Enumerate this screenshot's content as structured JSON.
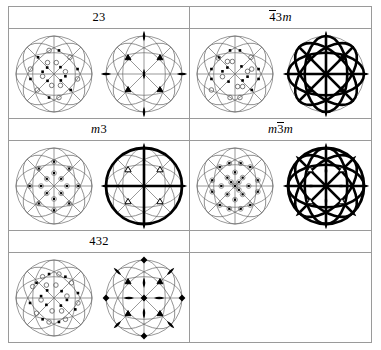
{
  "table": {
    "rows": [
      {
        "headers": [
          {
            "name": "point-group-23",
            "parts": [
              {
                "t": "23",
                "style": "plain"
              }
            ]
          },
          {
            "name": "point-group-4bar3m",
            "parts": [
              {
                "t": "4",
                "style": "overbar"
              },
              {
                "t": "3",
                "style": "plain"
              },
              {
                "t": "m",
                "style": "italic"
              }
            ]
          }
        ],
        "cells": [
          {
            "name": "stereogram-23",
            "kind": "projection",
            "group": "23"
          },
          {
            "name": "symmetry-diagram-23",
            "kind": "symmetry",
            "group": "23"
          },
          {
            "name": "stereogram-4bar3m",
            "kind": "projection",
            "group": "-43m"
          },
          {
            "name": "symmetry-diagram-4bar3m",
            "kind": "symmetry",
            "group": "-43m"
          }
        ]
      },
      {
        "headers": [
          {
            "name": "point-group-m3",
            "parts": [
              {
                "t": "m",
                "style": "italic"
              },
              {
                "t": "3",
                "style": "plain"
              }
            ]
          },
          {
            "name": "point-group-m3barm",
            "parts": [
              {
                "t": "m",
                "style": "italic"
              },
              {
                "t": "3",
                "style": "overbar"
              },
              {
                "t": "m",
                "style": "italic"
              }
            ]
          }
        ],
        "cells": [
          {
            "name": "stereogram-m3",
            "kind": "projection",
            "group": "m3"
          },
          {
            "name": "symmetry-diagram-m3",
            "kind": "symmetry",
            "group": "m3"
          },
          {
            "name": "stereogram-m3barm",
            "kind": "projection",
            "group": "m-3m"
          },
          {
            "name": "symmetry-diagram-m3barm",
            "kind": "symmetry",
            "group": "m-3m"
          }
        ]
      },
      {
        "headers": [
          {
            "name": "point-group-432",
            "parts": [
              {
                "t": "432",
                "style": "plain"
              }
            ]
          },
          {
            "name": "point-group-empty",
            "parts": []
          }
        ],
        "cells": [
          {
            "name": "stereogram-432",
            "kind": "projection",
            "group": "432"
          },
          {
            "name": "symmetry-diagram-432",
            "kind": "symmetry",
            "group": "432"
          },
          {
            "name": "empty-cell-1",
            "kind": "empty",
            "group": ""
          },
          {
            "name": "empty-cell-2",
            "kind": "empty",
            "group": ""
          }
        ]
      }
    ]
  },
  "colors": {
    "ink": "#000000",
    "grid_line": "#9a9a9a",
    "thin_line": "#6b6b6b",
    "background": "#ffffff"
  },
  "geometry": {
    "circle_radius": 38,
    "inner_ellipse_ratio": 0.56
  },
  "legend": {
    "filled_square": "general position above plane",
    "open_circle": "general position below plane",
    "lens": "two-fold rotation axis",
    "filled_triangle": "three-fold rotation axis",
    "open_triangle": "three-fold rotoinversion axis",
    "filled_square_axis": "four-fold rotation axis",
    "open_square_lens": "four-fold rotoinversion axis",
    "bold_line": "mirror plane",
    "bold_circle": "horizontal mirror plane"
  },
  "projections": {
    "23": {
      "point_count": 12,
      "upper": [
        {
          "x": -0.42,
          "y": -0.44
        },
        {
          "x": 0.13,
          "y": -0.62
        },
        {
          "x": 0.62,
          "y": -0.13
        },
        {
          "x": 0.44,
          "y": 0.42
        },
        {
          "x": -0.13,
          "y": 0.62
        },
        {
          "x": -0.62,
          "y": 0.13
        },
        {
          "x": -0.18,
          "y": -0.17
        },
        {
          "x": 0.17,
          "y": -0.18
        },
        {
          "x": 0.18,
          "y": 0.17
        },
        {
          "x": -0.17,
          "y": 0.18
        },
        {
          "x": 0.3,
          "y": 0.06
        },
        {
          "x": -0.3,
          "y": -0.06
        }
      ],
      "lower": [
        {
          "x": -0.13,
          "y": -0.62
        },
        {
          "x": 0.42,
          "y": -0.44
        },
        {
          "x": 0.62,
          "y": 0.13
        },
        {
          "x": 0.13,
          "y": 0.62
        },
        {
          "x": -0.44,
          "y": 0.42
        },
        {
          "x": -0.62,
          "y": -0.13
        },
        {
          "x": 0.06,
          "y": -0.3
        },
        {
          "x": 0.3,
          "y": -0.06
        },
        {
          "x": -0.06,
          "y": 0.3
        },
        {
          "x": -0.3,
          "y": 0.06
        },
        {
          "x": 0.17,
          "y": 0.3
        },
        {
          "x": -0.17,
          "y": -0.3
        }
      ]
    },
    "-43m": {
      "point_count": 24,
      "upper": [
        {
          "x": -0.42,
          "y": -0.44
        },
        {
          "x": -0.13,
          "y": -0.62
        },
        {
          "x": 0.13,
          "y": -0.62
        },
        {
          "x": 0.62,
          "y": -0.13
        },
        {
          "x": 0.62,
          "y": 0.13
        },
        {
          "x": 0.44,
          "y": 0.42
        },
        {
          "x": -0.62,
          "y": 0.13
        },
        {
          "x": -0.62,
          "y": -0.13
        },
        {
          "x": -0.2,
          "y": -0.17
        },
        {
          "x": 0.17,
          "y": -0.2
        },
        {
          "x": 0.2,
          "y": 0.17
        },
        {
          "x": -0.17,
          "y": 0.2
        },
        {
          "x": 0.33,
          "y": 0.07
        },
        {
          "x": -0.33,
          "y": -0.07
        }
      ],
      "lower": [
        {
          "x": -0.62,
          "y": 0.42
        },
        {
          "x": 0.42,
          "y": -0.44
        },
        {
          "x": 0.13,
          "y": 0.62
        },
        {
          "x": -0.13,
          "y": 0.62
        },
        {
          "x": -0.44,
          "y": -0.42
        },
        {
          "x": 0.44,
          "y": -0.13
        },
        {
          "x": -0.07,
          "y": -0.33
        },
        {
          "x": 0.33,
          "y": -0.07
        },
        {
          "x": 0.07,
          "y": 0.33
        },
        {
          "x": -0.33,
          "y": 0.07
        },
        {
          "x": 0.2,
          "y": 0.33
        },
        {
          "x": -0.2,
          "y": -0.33
        }
      ]
    },
    "m3": {
      "point_count": 24,
      "paired": true,
      "upper": [
        {
          "x": -0.4,
          "y": -0.46
        },
        {
          "x": 0.4,
          "y": -0.46
        },
        {
          "x": 0.4,
          "y": 0.46
        },
        {
          "x": -0.4,
          "y": 0.46
        },
        {
          "x": -0.64,
          "y": 0.0
        },
        {
          "x": 0.64,
          "y": 0.0
        },
        {
          "x": 0.0,
          "y": -0.64
        },
        {
          "x": 0.0,
          "y": 0.64
        },
        {
          "x": -0.19,
          "y": -0.19
        },
        {
          "x": 0.19,
          "y": -0.19
        },
        {
          "x": 0.19,
          "y": 0.19
        },
        {
          "x": -0.19,
          "y": 0.19
        },
        {
          "x": -0.34,
          "y": 0.0
        },
        {
          "x": 0.34,
          "y": 0.0
        },
        {
          "x": 0.0,
          "y": -0.34
        },
        {
          "x": 0.0,
          "y": 0.34
        }
      ],
      "lower": []
    },
    "m-3m": {
      "point_count": 48,
      "paired": true,
      "upper": [
        {
          "x": -0.4,
          "y": -0.5
        },
        {
          "x": -0.15,
          "y": -0.6
        },
        {
          "x": 0.15,
          "y": -0.6
        },
        {
          "x": 0.4,
          "y": -0.5
        },
        {
          "x": 0.6,
          "y": -0.15
        },
        {
          "x": 0.6,
          "y": 0.15
        },
        {
          "x": 0.4,
          "y": 0.5
        },
        {
          "x": 0.15,
          "y": 0.6
        },
        {
          "x": -0.15,
          "y": 0.6
        },
        {
          "x": -0.4,
          "y": 0.5
        },
        {
          "x": -0.6,
          "y": 0.15
        },
        {
          "x": -0.6,
          "y": -0.15
        },
        {
          "x": -0.2,
          "y": -0.22
        },
        {
          "x": 0.2,
          "y": -0.22
        },
        {
          "x": 0.2,
          "y": 0.22
        },
        {
          "x": -0.2,
          "y": 0.22
        },
        {
          "x": -0.36,
          "y": 0.0
        },
        {
          "x": 0.36,
          "y": 0.0
        },
        {
          "x": 0.0,
          "y": -0.36
        },
        {
          "x": 0.0,
          "y": 0.36
        },
        {
          "x": 0.0,
          "y": 0.0
        },
        {
          "x": -0.1,
          "y": -0.1
        },
        {
          "x": 0.1,
          "y": -0.1
        },
        {
          "x": 0.1,
          "y": 0.1
        }
      ],
      "lower": []
    },
    "432": {
      "point_count": 24,
      "upper": [
        {
          "x": -0.46,
          "y": -0.4
        },
        {
          "x": -0.13,
          "y": -0.63
        },
        {
          "x": 0.3,
          "y": -0.56
        },
        {
          "x": 0.63,
          "y": -0.13
        },
        {
          "x": 0.56,
          "y": 0.3
        },
        {
          "x": 0.13,
          "y": 0.63
        },
        {
          "x": -0.3,
          "y": 0.56
        },
        {
          "x": -0.63,
          "y": 0.13
        },
        {
          "x": -0.18,
          "y": -0.2
        },
        {
          "x": 0.2,
          "y": -0.18
        },
        {
          "x": 0.18,
          "y": 0.2
        },
        {
          "x": -0.2,
          "y": 0.18
        },
        {
          "x": 0.34,
          "y": 0.05
        },
        {
          "x": -0.34,
          "y": -0.05
        }
      ],
      "lower": [
        {
          "x": -0.3,
          "y": -0.56
        },
        {
          "x": 0.13,
          "y": -0.63
        },
        {
          "x": 0.46,
          "y": -0.4
        },
        {
          "x": 0.63,
          "y": 0.13
        },
        {
          "x": 0.3,
          "y": 0.56
        },
        {
          "x": -0.13,
          "y": 0.63
        },
        {
          "x": -0.46,
          "y": 0.4
        },
        {
          "x": -0.56,
          "y": -0.3
        },
        {
          "x": 0.05,
          "y": -0.34
        },
        {
          "x": 0.34,
          "y": -0.05
        },
        {
          "x": -0.05,
          "y": 0.34
        },
        {
          "x": -0.34,
          "y": 0.05
        },
        {
          "x": 0.2,
          "y": 0.34
        },
        {
          "x": -0.2,
          "y": -0.34
        }
      ]
    }
  },
  "symmetry_elements": {
    "23": {
      "bold_outer_circle": false,
      "mirror_lines": [],
      "twofold_lens": [
        {
          "x": 0,
          "y": -1
        },
        {
          "x": 1,
          "y": 0
        },
        {
          "x": 0,
          "y": 1
        },
        {
          "x": -1,
          "y": 0
        },
        {
          "x": 0,
          "y": 0
        }
      ],
      "threefold_filled": [
        {
          "x": -0.42,
          "y": -0.42
        },
        {
          "x": 0.42,
          "y": -0.42
        },
        {
          "x": 0.42,
          "y": 0.42
        },
        {
          "x": -0.42,
          "y": 0.42
        }
      ],
      "threefold_open": [],
      "fourfold_filled": [],
      "fourfold_lens": []
    },
    "-43m": {
      "bold_outer_circle": false,
      "mirror_lines": [
        "v",
        "h",
        "d1",
        "d2",
        "ell-v",
        "ell-h",
        "arc-d1",
        "arc-d2"
      ],
      "twofold_lens": [
        {
          "x": 0,
          "y": -1
        },
        {
          "x": 1,
          "y": 0
        },
        {
          "x": 0,
          "y": 1
        },
        {
          "x": -1,
          "y": 0
        },
        {
          "x": 0,
          "y": 0
        }
      ],
      "threefold_filled": [
        {
          "x": -0.42,
          "y": -0.42
        },
        {
          "x": 0.42,
          "y": -0.42
        },
        {
          "x": 0.42,
          "y": 0.42
        },
        {
          "x": -0.42,
          "y": 0.42
        }
      ],
      "threefold_open": [],
      "fourfold_filled": [],
      "fourfold_lens": []
    },
    "m3": {
      "bold_outer_circle": true,
      "mirror_lines": [
        "v",
        "h"
      ],
      "twofold_lens": [
        {
          "x": 0,
          "y": -1
        },
        {
          "x": 1,
          "y": 0
        },
        {
          "x": 0,
          "y": 1
        },
        {
          "x": -1,
          "y": 0
        },
        {
          "x": 0,
          "y": 0
        }
      ],
      "threefold_filled": [],
      "threefold_open": [
        {
          "x": -0.42,
          "y": -0.42
        },
        {
          "x": 0.42,
          "y": -0.42
        },
        {
          "x": 0.42,
          "y": 0.42
        },
        {
          "x": -0.42,
          "y": 0.42
        }
      ],
      "fourfold_filled": [],
      "fourfold_lens": []
    },
    "m-3m": {
      "bold_outer_circle": true,
      "mirror_lines": [
        "v",
        "h",
        "d1",
        "d2",
        "ell-v",
        "ell-h",
        "arc-d1",
        "arc-d2"
      ],
      "twofold_lens": [
        {
          "x": 0,
          "y": -1
        },
        {
          "x": 1,
          "y": 0
        },
        {
          "x": 0,
          "y": 1
        },
        {
          "x": -1,
          "y": 0
        },
        {
          "x": -0.7,
          "y": -0.7
        },
        {
          "x": 0.7,
          "y": -0.7
        },
        {
          "x": 0.7,
          "y": 0.7
        },
        {
          "x": -0.7,
          "y": 0.7
        },
        {
          "x": -0.4,
          "y": 0
        },
        {
          "x": 0.4,
          "y": 0
        },
        {
          "x": 0,
          "y": -0.4
        },
        {
          "x": 0,
          "y": 0.4
        },
        {
          "x": 0,
          "y": 0
        }
      ],
      "threefold_filled": [],
      "threefold_open": [
        {
          "x": -0.42,
          "y": -0.42
        },
        {
          "x": 0.42,
          "y": -0.42
        },
        {
          "x": 0.42,
          "y": 0.42
        },
        {
          "x": -0.42,
          "y": 0.42
        }
      ],
      "fourfold_filled": [],
      "fourfold_lens": []
    },
    "432": {
      "bold_outer_circle": false,
      "mirror_lines": [],
      "twofold_lens": [
        {
          "x": -0.7,
          "y": -0.7
        },
        {
          "x": 0.7,
          "y": -0.7
        },
        {
          "x": 0.7,
          "y": 0.7
        },
        {
          "x": -0.7,
          "y": 0.7
        },
        {
          "x": -0.4,
          "y": 0
        },
        {
          "x": 0.4,
          "y": 0
        },
        {
          "x": 0,
          "y": -0.4
        },
        {
          "x": 0,
          "y": 0.4
        }
      ],
      "threefold_filled": [
        {
          "x": -0.42,
          "y": -0.42
        },
        {
          "x": 0.42,
          "y": -0.42
        },
        {
          "x": 0.42,
          "y": 0.42
        },
        {
          "x": -0.42,
          "y": 0.42
        }
      ],
      "threefold_open": [],
      "fourfold_filled": [
        {
          "x": 0,
          "y": -1
        },
        {
          "x": 1,
          "y": 0
        },
        {
          "x": 0,
          "y": 1
        },
        {
          "x": -1,
          "y": 0
        },
        {
          "x": 0,
          "y": 0
        }
      ],
      "fourfold_lens": []
    }
  }
}
